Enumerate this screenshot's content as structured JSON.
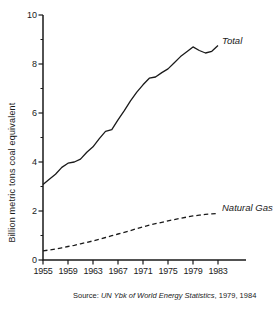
{
  "chart_data": {
    "type": "line",
    "title": "",
    "xlabel": "",
    "ylabel": "Billion metric tons coal equivalent",
    "ylim": [
      0,
      10
    ],
    "xlim": [
      1955,
      1987.5
    ],
    "yticks": [
      0,
      2,
      4,
      6,
      8,
      10
    ],
    "yticks_minor": [
      1,
      3,
      5,
      7,
      9
    ],
    "xticks": [
      1955,
      1959,
      1963,
      1967,
      1971,
      1975,
      1979,
      1983
    ],
    "grid": false,
    "legend_position": "inline-labels-at-line-ends",
    "line_color": "#1a1a1a",
    "series": [
      {
        "name": "Total",
        "line_style": "solid",
        "color": "#1a1a1a",
        "points": [
          [
            1955,
            3.08
          ],
          [
            1956,
            3.3
          ],
          [
            1957,
            3.5
          ],
          [
            1958,
            3.78
          ],
          [
            1959,
            3.95
          ],
          [
            1960,
            4.0
          ],
          [
            1961,
            4.12
          ],
          [
            1962,
            4.4
          ],
          [
            1963,
            4.62
          ],
          [
            1964,
            4.95
          ],
          [
            1965,
            5.25
          ],
          [
            1966,
            5.32
          ],
          [
            1967,
            5.72
          ],
          [
            1968,
            6.1
          ],
          [
            1969,
            6.5
          ],
          [
            1970,
            6.85
          ],
          [
            1971,
            7.15
          ],
          [
            1972,
            7.42
          ],
          [
            1973,
            7.47
          ],
          [
            1974,
            7.65
          ],
          [
            1975,
            7.8
          ],
          [
            1976,
            8.05
          ],
          [
            1977,
            8.3
          ],
          [
            1978,
            8.5
          ],
          [
            1979,
            8.7
          ],
          [
            1980,
            8.55
          ],
          [
            1981,
            8.45
          ],
          [
            1982,
            8.52
          ],
          [
            1983,
            8.75
          ]
        ]
      },
      {
        "name": "Natural Gas",
        "line_style": "dashed",
        "color": "#1a1a1a",
        "points": [
          [
            1955,
            0.37
          ],
          [
            1956,
            0.41
          ],
          [
            1957,
            0.45
          ],
          [
            1958,
            0.5
          ],
          [
            1959,
            0.55
          ],
          [
            1960,
            0.6
          ],
          [
            1961,
            0.66
          ],
          [
            1962,
            0.72
          ],
          [
            1963,
            0.78
          ],
          [
            1964,
            0.85
          ],
          [
            1965,
            0.92
          ],
          [
            1966,
            0.99
          ],
          [
            1967,
            1.06
          ],
          [
            1968,
            1.13
          ],
          [
            1969,
            1.2
          ],
          [
            1970,
            1.28
          ],
          [
            1971,
            1.35
          ],
          [
            1972,
            1.42
          ],
          [
            1973,
            1.48
          ],
          [
            1974,
            1.54
          ],
          [
            1975,
            1.6
          ],
          [
            1976,
            1.65
          ],
          [
            1977,
            1.7
          ],
          [
            1978,
            1.75
          ],
          [
            1979,
            1.8
          ],
          [
            1980,
            1.83
          ],
          [
            1981,
            1.86
          ],
          [
            1982,
            1.88
          ],
          [
            1983,
            1.9
          ]
        ]
      }
    ]
  },
  "source_note": {
    "prefix": "Source: ",
    "citation": "UN Ybk of World Energy Statistics",
    "suffix": ", 1979, 1984"
  }
}
